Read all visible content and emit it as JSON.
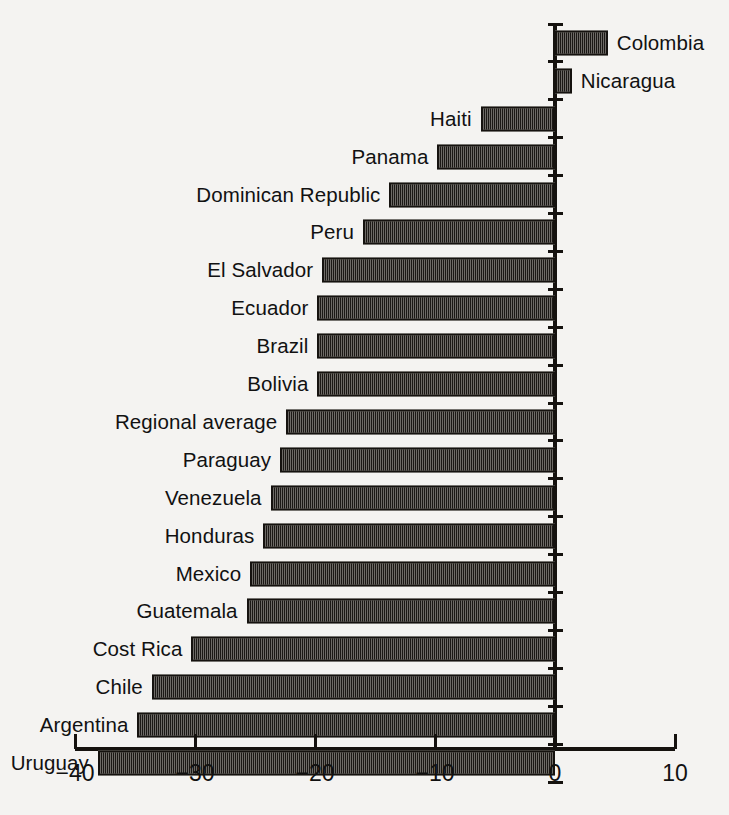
{
  "chart_data": {
    "type": "bar",
    "orientation": "horizontal",
    "title": "",
    "subtitle": "",
    "xlabel": "",
    "ylabel": "",
    "xlim": [
      -40,
      10
    ],
    "ylim": null,
    "grid": false,
    "legend": null,
    "x_ticks": [
      -40,
      -30,
      -20,
      -10,
      0,
      10
    ],
    "x_tick_labels": [
      "−40",
      "−30",
      "−20",
      "−10",
      "0",
      "10"
    ],
    "zero_line": 0,
    "categories": [
      "Colombia",
      "Nicaragua",
      "Haiti",
      "Panama",
      "Dominican Republic",
      "Peru",
      "El Salvador",
      "Ecuador",
      "Brazil",
      "Bolivia",
      "Regional average",
      "Paraguay",
      "Venezuela",
      "Honduras",
      "Mexico",
      "Guatemala",
      "Cost Rica",
      "Chile",
      "Argentina",
      "Uruguay"
    ],
    "values": [
      4.4,
      1.4,
      -6.2,
      -9.8,
      -13.8,
      -16.0,
      -19.4,
      -19.8,
      -19.8,
      -19.8,
      -22.4,
      -22.9,
      -23.7,
      -24.3,
      -25.4,
      -25.7,
      -30.3,
      -33.6,
      -34.8,
      -38.1
    ],
    "bar_fill_color": "#b9b6b1",
    "bar_edge_color": "#15120f",
    "bar_fill_pattern": "fine-checkerboard-dither",
    "axis_color": "#15120f",
    "background_color": "#f4f3f1",
    "text_color": "#111111"
  }
}
